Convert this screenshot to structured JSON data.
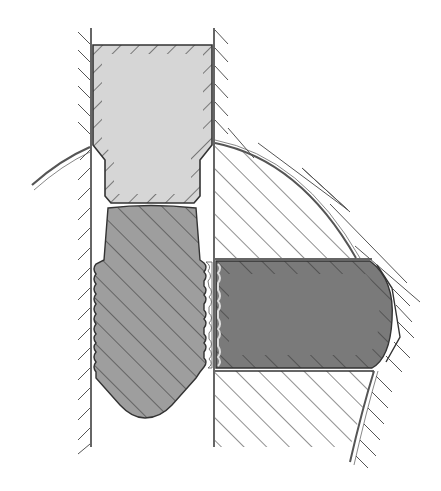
{
  "figure": {
    "title": "Cross-section of threaded plug and locking pin in bore",
    "parts": [
      {
        "id": "bore-wall-left",
        "label": "Left bore wall (hatched)"
      },
      {
        "id": "bore-wall-right",
        "label": "Right bore wall (hatched)"
      },
      {
        "id": "cap",
        "label": "Stepped cap (light grey, hatched edge)"
      },
      {
        "id": "threaded-plug",
        "label": "Threaded plug (mid grey, hatched)"
      },
      {
        "id": "locking-block",
        "label": "Transverse locking block (dark grey)"
      },
      {
        "id": "housing",
        "label": "Curved housing section (hatched)"
      }
    ]
  },
  "colors": {
    "background": "#ffffff",
    "line": "#333333",
    "hatch": "#444444",
    "cap_fill": "#d6d6d6",
    "plug_fill": "#9e9e9e",
    "block_fill": "#7a7a7a"
  }
}
